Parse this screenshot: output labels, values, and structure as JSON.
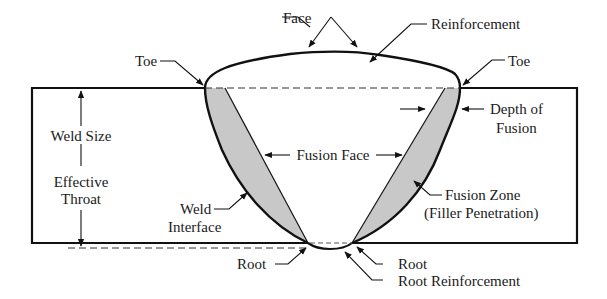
{
  "diagram": {
    "colors": {
      "line": "#111111",
      "fusion_zone_fill": "#c8c8c8",
      "background": "#ffffff"
    },
    "labels": {
      "face": "Face",
      "reinforcement": "Reinforcement",
      "toe_left": "Toe",
      "toe_right": "Toe",
      "depth_of_fusion_line1": "Depth of",
      "depth_of_fusion_line2": "Fusion",
      "weld_size": "Weld Size",
      "effective_throat_line1": "Effective",
      "effective_throat_line2": "Throat",
      "fusion_face": "Fusion Face",
      "weld_interface_line1": "Weld",
      "weld_interface_line2": "Interface",
      "fusion_zone_line1": "Fusion Zone",
      "fusion_zone_line2": "(Filler Penetration)",
      "root_left": "Root",
      "root_right": "Root",
      "root_reinforcement": "Root Reinforcement"
    }
  }
}
